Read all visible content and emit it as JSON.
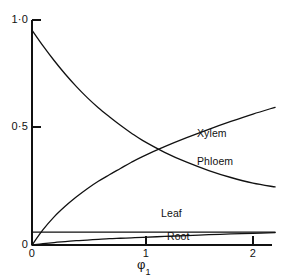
{
  "figure": {
    "background_color": "#ffffff",
    "line_color": "#111111"
  },
  "chart_data": {
    "type": "line",
    "title": "",
    "subtitle": "",
    "xlabel": "φ₁",
    "ylabel": "",
    "xlim": [
      0,
      2.23
    ],
    "ylim": [
      0,
      1.0
    ],
    "xticks": [
      0,
      1,
      2
    ],
    "xticklabels": [
      "0",
      "1",
      "2"
    ],
    "yticks": [
      0,
      0.5,
      1.0
    ],
    "yticklabels": [
      "0",
      "0·5",
      "1·0"
    ],
    "grid": false,
    "legend": "inline-curve-labels",
    "x": [
      0,
      0.1,
      0.2,
      0.3,
      0.4,
      0.5,
      0.6,
      0.7,
      0.8,
      0.9,
      1.0,
      1.2,
      1.4,
      1.6,
      1.8,
      2.0,
      2.2
    ],
    "series": [
      {
        "name": "Xylem",
        "label": "Xylem",
        "label_x": 1.5,
        "label_y": 0.5,
        "values": [
          0,
          0.068,
          0.125,
          0.172,
          0.213,
          0.25,
          0.283,
          0.312,
          0.34,
          0.368,
          0.393,
          0.437,
          0.477,
          0.514,
          0.549,
          0.582,
          0.612
        ]
      },
      {
        "name": "Phloem",
        "label": "Phloem",
        "label_x": 1.5,
        "label_y": 0.375,
        "values": [
          0.955,
          0.885,
          0.82,
          0.76,
          0.705,
          0.655,
          0.61,
          0.57,
          0.532,
          0.497,
          0.465,
          0.412,
          0.368,
          0.331,
          0.3,
          0.275,
          0.258
        ]
      },
      {
        "name": "Leaf",
        "label": "Leaf",
        "label_x": 1.18,
        "label_y": 0.135,
        "values": [
          0.057,
          0.057,
          0.057,
          0.057,
          0.057,
          0.057,
          0.057,
          0.057,
          0.057,
          0.057,
          0.057,
          0.057,
          0.057,
          0.057,
          0.057,
          0.057,
          0.057
        ]
      },
      {
        "name": "Root",
        "label": "Root",
        "label_x": 1.23,
        "label_y": 0.035,
        "values": [
          0,
          0.006,
          0.011,
          0.015,
          0.019,
          0.022,
          0.025,
          0.028,
          0.03,
          0.032,
          0.034,
          0.038,
          0.042,
          0.046,
          0.049,
          0.052,
          0.055
        ]
      }
    ],
    "annotations": [
      {
        "text": "Xylem and Phloem curves intersect near φ₁ = 1.0, value ≈ 0.43"
      }
    ]
  },
  "axes": {
    "y_tick_top_label": "1·0",
    "y_tick_mid_label": "0·5",
    "y_tick_zero_label": "0",
    "x_tick_zero_label": "0",
    "x_tick_one_label": "1",
    "x_tick_two_label": "2",
    "x_axis_title_symbol": "φ",
    "x_axis_title_subscript": "1"
  },
  "labels": {
    "xylem": "Xylem",
    "phloem": "Phloem",
    "leaf": "Leaf",
    "root": "Root"
  }
}
